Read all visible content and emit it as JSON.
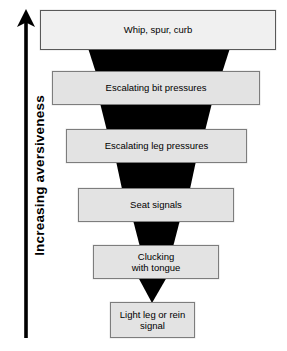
{
  "figure": {
    "axis": {
      "label": "Increasing aversiveness",
      "direction": "up",
      "arrow_color": "#000000"
    },
    "funnel_color": "#000000",
    "box_fill": "#e3e3e3",
    "box_border": "#7d7d7d",
    "top_box_fill": "#f0f0f0",
    "stages": [
      {
        "label": "Whip, spur, curb"
      },
      {
        "label": "Escalating bit pressures"
      },
      {
        "label": "Escalating leg pressures"
      },
      {
        "label": "Seat signals"
      },
      {
        "label": "Clucking\nwith tongue"
      },
      {
        "label": "Light leg or rein\nsignal"
      }
    ]
  }
}
